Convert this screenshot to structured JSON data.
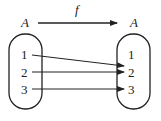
{
  "diagram": {
    "domain_label": "A",
    "codomain_label": "A",
    "function_label": "f",
    "domain_elements": [
      "1",
      "2",
      "3"
    ],
    "codomain_elements": [
      "1",
      "2",
      "3"
    ],
    "mapping": [
      {
        "from": "1",
        "to": "2"
      },
      {
        "from": "2",
        "to": "2"
      },
      {
        "from": "3",
        "to": "3"
      }
    ],
    "line_color": "#222222"
  }
}
